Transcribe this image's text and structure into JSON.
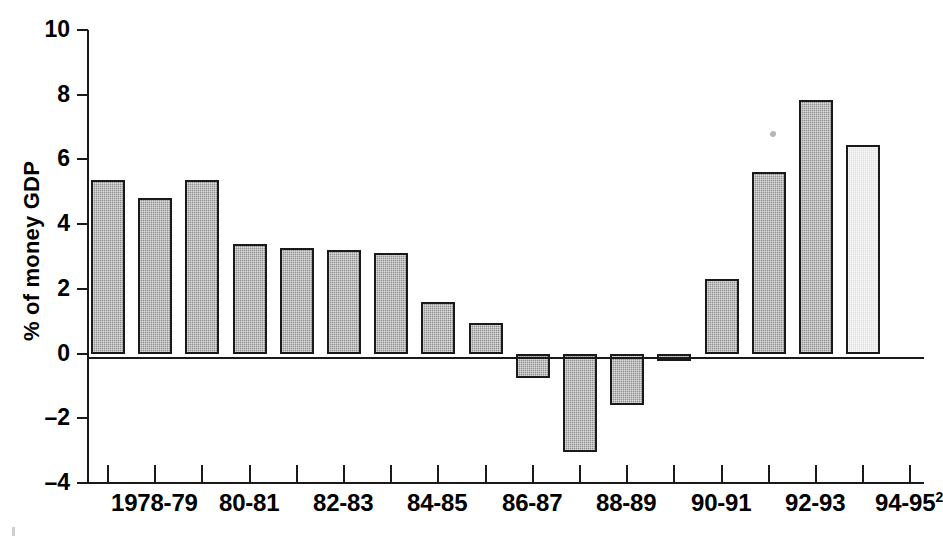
{
  "chart_data": {
    "type": "bar",
    "title": "",
    "xlabel": "",
    "ylabel": "% of money GDP",
    "ylim": [
      -4,
      10
    ],
    "yticks": [
      10,
      8,
      6,
      4,
      2,
      0,
      -2,
      -4
    ],
    "ytick_labels": [
      "10",
      "8",
      "6",
      "4",
      "2",
      "0",
      "-2",
      "-4"
    ],
    "grid": false,
    "legend": null,
    "zero_line": true,
    "categories": [
      "1978-79",
      "1979-80",
      "80-81",
      "81-82",
      "82-83",
      "83-84",
      "84-85",
      "85-86",
      "86-87",
      "87-88",
      "88-89",
      "89-90",
      "90-91",
      "91-92",
      "92-93",
      "93-94",
      "94-95"
    ],
    "xtick_labels": [
      {
        "text": "1978-79",
        "superscript": ""
      },
      {
        "text": "80-81",
        "superscript": ""
      },
      {
        "text": "82-83",
        "superscript": ""
      },
      {
        "text": "84-85",
        "superscript": ""
      },
      {
        "text": "86-87",
        "superscript": ""
      },
      {
        "text": "88-89",
        "superscript": ""
      },
      {
        "text": "90-91",
        "superscript": ""
      },
      {
        "text": "92-93",
        "superscript": ""
      },
      {
        "text": "94-95",
        "superscript": "2"
      }
    ],
    "values": [
      5.35,
      4.8,
      5.35,
      3.4,
      3.25,
      3.2,
      3.1,
      1.6,
      0.95,
      -0.75,
      -3.05,
      -1.6,
      -0.15,
      2.3,
      5.6,
      7.85,
      6.45
    ],
    "series": [
      {
        "name": "% of money GDP",
        "values": [
          5.35,
          4.8,
          5.35,
          3.4,
          3.25,
          3.2,
          3.1,
          1.6,
          0.95,
          -0.75,
          -3.05,
          -1.6,
          -0.15,
          2.3,
          5.6,
          7.85,
          6.45
        ]
      }
    ],
    "bar_styles": [
      "shaded",
      "shaded",
      "shaded",
      "shaded",
      "shaded",
      "shaded",
      "shaded",
      "shaded",
      "shaded",
      "shaded",
      "shaded",
      "shaded",
      "shaded",
      "shaded",
      "shaded",
      "shaded",
      "light"
    ],
    "colors": {
      "bar_fill": "#8f8f8f",
      "bar_fill_light": "#dedede",
      "bar_outline": "#1a1a1a",
      "axis": "#1a1a1a",
      "background": "#ffffff"
    }
  }
}
